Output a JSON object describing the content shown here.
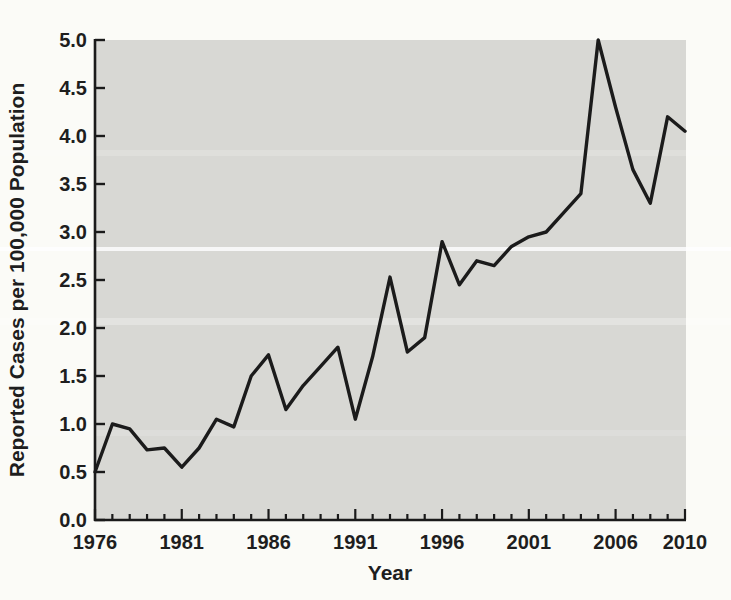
{
  "figure": {
    "background_color": "#fbfbf7",
    "plot_background_color": "#d8d8d4",
    "line_color": "#1b1b1b",
    "text_color": "#1e1e1e",
    "axis_color": "#1a1a1a"
  },
  "chart_data": {
    "type": "line",
    "title": "",
    "xlabel": "Year",
    "ylabel": "Reported Cases per 100,000 Population",
    "xlim": [
      1976,
      2010
    ],
    "ylim": [
      0.0,
      5.0
    ],
    "grid": false,
    "legend": false,
    "x_major_ticks": [
      1976,
      1981,
      1986,
      1991,
      1996,
      2001,
      2006,
      2010
    ],
    "x_minor_tick_interval": 1,
    "y_tick_labels": [
      "0.0",
      "0.5",
      "1.0",
      "1.5",
      "2.0",
      "2.5",
      "3.0",
      "3.5",
      "4.0",
      "4.5",
      "5.0"
    ],
    "series": [
      {
        "name": "Reported cases per 100,000 population",
        "x": [
          1976,
          1977,
          1978,
          1979,
          1980,
          1981,
          1982,
          1983,
          1984,
          1985,
          1986,
          1987,
          1988,
          1989,
          1990,
          1991,
          1992,
          1993,
          1994,
          1995,
          1996,
          1997,
          1998,
          1999,
          2000,
          2001,
          2002,
          2003,
          2004,
          2005,
          2006,
          2007,
          2008,
          2009,
          2010
        ],
        "values": [
          0.5,
          1.0,
          0.95,
          0.73,
          0.75,
          0.55,
          0.75,
          1.05,
          0.97,
          1.5,
          1.72,
          1.15,
          1.4,
          1.6,
          1.8,
          1.05,
          1.7,
          2.53,
          1.75,
          1.9,
          2.9,
          2.45,
          2.7,
          2.65,
          2.85,
          2.95,
          3.0,
          3.2,
          3.4,
          5.0,
          4.3,
          3.65,
          3.3,
          4.2,
          4.05
        ]
      }
    ]
  }
}
